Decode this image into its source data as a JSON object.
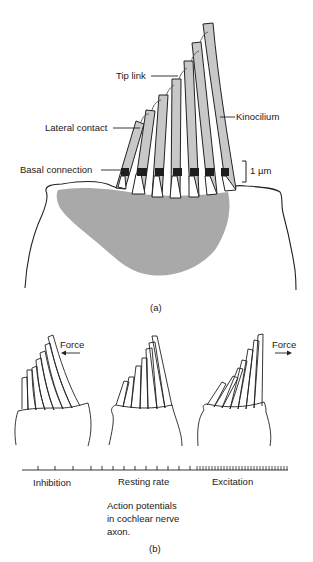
{
  "figure": {
    "panel_a": {
      "caption": "(a)",
      "labels": {
        "tip_link": "Tip link",
        "lateral_contact": "Lateral contact",
        "kinocilium": "Kinocilium",
        "basal_connection": "Basal connection",
        "scale_bar": "1 µm"
      },
      "colors": {
        "stereocilia_fill": "#c8c8c8",
        "cuticular_plate": "#a9a9a9",
        "basal_connection": "#1e1e1e",
        "outline": "#222222"
      },
      "stereocilia_count": 7
    },
    "panel_b": {
      "caption": "(b)",
      "cells": [
        {
          "state": "inhibition",
          "force_label": "Force",
          "force_direction": "left"
        },
        {
          "state": "resting",
          "force_label": "",
          "force_direction": "none"
        },
        {
          "state": "excitation",
          "force_label": "Force",
          "force_direction": "right"
        }
      ],
      "spike_train": {
        "labels": {
          "inhibition": "Inhibition",
          "resting": "Resting rate",
          "excitation": "Excitation"
        },
        "description_lines": [
          "Action potentials",
          "in cochlear nerve",
          "axon."
        ]
      }
    }
  }
}
